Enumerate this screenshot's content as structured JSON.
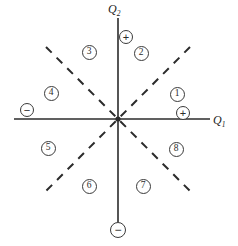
{
  "figure": {
    "origin": {
      "x": 118,
      "y": 119
    },
    "stroke_color": "#2b2b2b",
    "background": "#ffffff"
  },
  "axes": [
    {
      "name": "horizontal-axis",
      "label": "Q",
      "subscript": "1",
      "label_x": 213,
      "label_y": 113,
      "style": "solid",
      "x1": 14,
      "y1": 119,
      "x2": 210,
      "y2": 119
    },
    {
      "name": "vertical-axis",
      "label": "Q",
      "subscript": "2",
      "label_x": 108,
      "label_y": 2,
      "style": "solid",
      "x1": 118,
      "y1": 18,
      "x2": 118,
      "y2": 222
    }
  ],
  "diagonals": [
    {
      "name": "diagonal-nw-se",
      "style": "dashed",
      "x1": 46,
      "y1": 47,
      "x2": 190,
      "y2": 191
    },
    {
      "name": "diagonal-ne-sw",
      "style": "dashed",
      "x1": 190,
      "y1": 47,
      "x2": 46,
      "y2": 191
    }
  ],
  "regions": [
    {
      "label": "1",
      "x": 177,
      "y": 94
    },
    {
      "label": "2",
      "x": 141,
      "y": 53
    },
    {
      "label": "3",
      "x": 89,
      "y": 52
    },
    {
      "label": "4",
      "x": 51,
      "y": 93
    },
    {
      "label": "5",
      "x": 48,
      "y": 148
    },
    {
      "label": "6",
      "x": 89,
      "y": 186
    },
    {
      "label": "7",
      "x": 143,
      "y": 186
    },
    {
      "label": "8",
      "x": 176,
      "y": 149
    }
  ],
  "signs": [
    {
      "name": "plus-q2-axis",
      "symbol": "+",
      "x": 126,
      "y": 37,
      "size": "normal"
    },
    {
      "name": "plus-q1-axis",
      "symbol": "+",
      "x": 183,
      "y": 113,
      "size": "normal"
    },
    {
      "name": "minus-q1-axis",
      "symbol": "−",
      "x": 27,
      "y": 110,
      "size": "normal"
    },
    {
      "name": "minus-q2-axis",
      "symbol": "−",
      "x": 118,
      "y": 230,
      "size": "big"
    }
  ]
}
